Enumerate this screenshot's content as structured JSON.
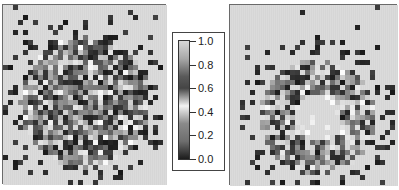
{
  "chart_data": [
    {
      "type": "heatmap",
      "title": "",
      "description": "Pixelated grayscale intensity map: filled disk of mixed gray values with sparse dark outliers",
      "grid": {
        "cols": 32,
        "rows": 36,
        "cell_px": 5
      },
      "pattern": {
        "shape": "disk",
        "center": [
          16,
          19
        ],
        "radius": 13,
        "scatter_radius": 17,
        "density": 0.92,
        "scatter_density": 0.06
      },
      "background": "#d6d6d6",
      "seed": 7
    },
    {
      "type": "heatmap",
      "title": "",
      "description": "Pixelated grayscale intensity map: ring/annulus of dark and mid gray values around a light hollow center, with sparse outer ring of dark points",
      "grid": {
        "cols": 33,
        "rows": 36,
        "cell_px": 5
      },
      "pattern": {
        "shape": "annulus",
        "center": [
          17,
          22
        ],
        "inner_radius": 5,
        "outer_radius": 11.5,
        "outer_scatter_radius": [
          13,
          16
        ],
        "density": 0.85,
        "scatter_density": 0.35
      },
      "background": "#d6d6d6",
      "seed": 13
    }
  ],
  "colorbar": {
    "min": 0.0,
    "max": 1.0,
    "ticks": [
      "1.0",
      "0.8",
      "0.6",
      "0.4",
      "0.2",
      "0.0"
    ],
    "gradient_stops": [
      {
        "value": 1.0,
        "color": "#d8d8d8"
      },
      {
        "value": 0.85,
        "color": "#a8a8a8"
      },
      {
        "value": 0.7,
        "color": "#5a5a5a"
      },
      {
        "value": 0.6,
        "color": "#454545"
      },
      {
        "value": 0.45,
        "color": "#f2f2f2"
      },
      {
        "value": 0.3,
        "color": "#8a8a8a"
      },
      {
        "value": 0.15,
        "color": "#6e6e6e"
      },
      {
        "value": 0.0,
        "color": "#1c1c1c"
      }
    ]
  }
}
